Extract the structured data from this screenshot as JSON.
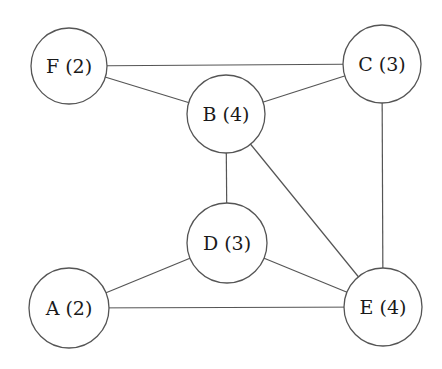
{
  "diagram": {
    "type": "undirected-graph",
    "nodes": [
      {
        "id": "F",
        "degree": 2,
        "label": "F (2)",
        "cx": 69,
        "cy": 66,
        "r": 38
      },
      {
        "id": "C",
        "degree": 3,
        "label": "C (3)",
        "cx": 382,
        "cy": 64,
        "r": 39
      },
      {
        "id": "B",
        "degree": 4,
        "label": "B (4)",
        "cx": 226,
        "cy": 114,
        "r": 39
      },
      {
        "id": "D",
        "degree": 3,
        "label": "D (3)",
        "cx": 227,
        "cy": 243,
        "r": 40
      },
      {
        "id": "A",
        "degree": 2,
        "label": "A (2)",
        "cx": 69,
        "cy": 308,
        "r": 40
      },
      {
        "id": "E",
        "degree": 4,
        "label": "E (4)",
        "cx": 383,
        "cy": 307,
        "r": 39
      }
    ],
    "edges": [
      {
        "from": "F",
        "to": "C"
      },
      {
        "from": "F",
        "to": "B"
      },
      {
        "from": "B",
        "to": "C"
      },
      {
        "from": "C",
        "to": "E"
      },
      {
        "from": "B",
        "to": "D"
      },
      {
        "from": "B",
        "to": "E"
      },
      {
        "from": "D",
        "to": "A"
      },
      {
        "from": "D",
        "to": "E"
      },
      {
        "from": "A",
        "to": "E"
      }
    ],
    "colors": {
      "background": "#ffffff",
      "stroke": "#555555",
      "text": "#1a1a1a"
    }
  }
}
